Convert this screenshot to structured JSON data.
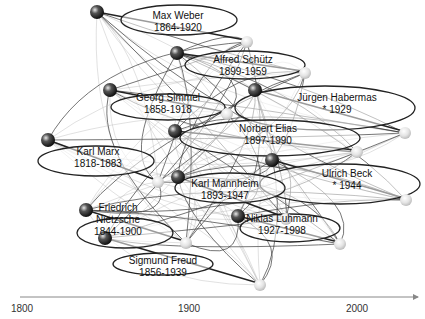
{
  "axis": {
    "start_year": 1800,
    "end_year": 2020,
    "ticks": [
      {
        "year": 1800,
        "label": "1800"
      },
      {
        "year": 1900,
        "label": "1900"
      },
      {
        "year": 2000,
        "label": "2000"
      }
    ]
  },
  "people": [
    {
      "id": "weber",
      "name": "Max Weber",
      "dates": "1864-1920",
      "birth": 1864,
      "death": 1920
    },
    {
      "id": "schuetz",
      "name": "Alfred Schütz",
      "dates": "1899-1959",
      "birth": 1899,
      "death": 1959
    },
    {
      "id": "simmel",
      "name": "Georg Simmel",
      "dates": "1858-1918",
      "birth": 1858,
      "death": 1918
    },
    {
      "id": "habermas",
      "name": "Jürgen Habermas",
      "dates": "* 1929",
      "birth": 1929,
      "death": null
    },
    {
      "id": "elias",
      "name": "Norbert Elias",
      "dates": "1897-1990",
      "birth": 1897,
      "death": 1990
    },
    {
      "id": "marx",
      "name": "Karl Marx",
      "dates": "1818-1883",
      "birth": 1818,
      "death": 1883
    },
    {
      "id": "beck",
      "name": "Ulrich Beck",
      "dates": "* 1944",
      "birth": 1944,
      "death": null
    },
    {
      "id": "mannheim",
      "name": "Karl Mannheim",
      "dates": "1893-1947",
      "birth": 1893,
      "death": 1947
    },
    {
      "id": "nietzsche",
      "name": "Friedrich Nietzsche",
      "name_lines": [
        "Friedrich",
        "Nietzsche"
      ],
      "dates": "1844-1900",
      "birth": 1844,
      "death": 1900
    },
    {
      "id": "luhmann",
      "name": "Niklas Luhmann",
      "dates": "1927-1998",
      "birth": 1927,
      "death": 1998
    },
    {
      "id": "freud",
      "name": "Sigmund Freud",
      "dates": "1856-1939",
      "birth": 1856,
      "death": 1939
    }
  ],
  "colors": {
    "line": "#333333",
    "light_line": "#aaaaaa",
    "axis": "#888888"
  }
}
